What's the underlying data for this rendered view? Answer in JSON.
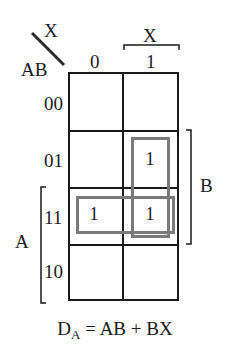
{
  "kmap": {
    "corner": {
      "col_var": "X",
      "row_var": "AB"
    },
    "col_headers": [
      "0",
      "1"
    ],
    "row_headers": [
      "00",
      "01",
      "11",
      "10"
    ],
    "cells": [
      [
        "",
        ""
      ],
      [
        "",
        "1"
      ],
      [
        "1",
        "1"
      ],
      [
        "",
        ""
      ]
    ],
    "brackets": {
      "top": "X",
      "right": "B",
      "left": "A"
    },
    "groups": [
      {
        "name": "AB",
        "rows": [
          2
        ],
        "cols": [
          0,
          1
        ]
      },
      {
        "name": "BX",
        "rows": [
          1,
          2
        ],
        "cols": [
          1
        ]
      }
    ],
    "group_color": "#7a7a7a"
  },
  "equation": {
    "lhs": "D",
    "lhs_sub": "A",
    "rhs": " = AB + BX"
  }
}
